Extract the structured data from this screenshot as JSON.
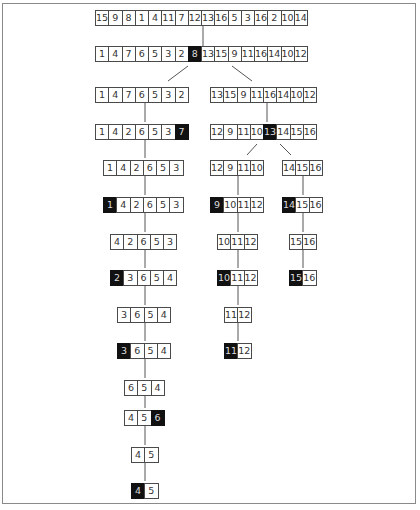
{
  "diagram": {
    "type": "quicksort-recursion-tree",
    "colors": {
      "pivot_bg": "#111111",
      "cell_border": "#4a4a4a",
      "text": "#333333"
    },
    "rows": [
      {
        "id": "r0",
        "x": 95,
        "y": 10,
        "values": [
          "15",
          "9",
          "8",
          "1",
          "4",
          "11",
          "7",
          "12",
          "13",
          "16",
          "5",
          "3",
          "16",
          "2",
          "10",
          "14"
        ],
        "pivot": -1
      },
      {
        "id": "r1",
        "x": 95,
        "y": 46,
        "values": [
          "1",
          "4",
          "7",
          "6",
          "5",
          "3",
          "2",
          "8",
          "13",
          "15",
          "9",
          "11",
          "16",
          "14",
          "10",
          "12"
        ],
        "pivot": 7
      },
      {
        "id": "r2a",
        "x": 95,
        "y": 87,
        "values": [
          "1",
          "4",
          "7",
          "6",
          "5",
          "3",
          "2"
        ],
        "pivot": -1
      },
      {
        "id": "r2b",
        "x": 210,
        "y": 87,
        "values": [
          "13",
          "15",
          "9",
          "11",
          "16",
          "14",
          "10",
          "12"
        ],
        "pivot": -1
      },
      {
        "id": "r3a",
        "x": 95,
        "y": 124,
        "values": [
          "1",
          "4",
          "2",
          "6",
          "5",
          "3",
          "7"
        ],
        "pivot": 6
      },
      {
        "id": "r3b",
        "x": 210,
        "y": 124,
        "values": [
          "12",
          "9",
          "11",
          "10",
          "13",
          "14",
          "15",
          "16"
        ],
        "pivot": 4
      },
      {
        "id": "r4a",
        "x": 103,
        "y": 160,
        "values": [
          "1",
          "4",
          "2",
          "6",
          "5",
          "3"
        ],
        "pivot": -1
      },
      {
        "id": "r4b",
        "x": 210,
        "y": 160,
        "values": [
          "12",
          "9",
          "11",
          "10"
        ],
        "pivot": -1
      },
      {
        "id": "r4c",
        "x": 282,
        "y": 160,
        "values": [
          "14",
          "15",
          "16"
        ],
        "pivot": -1
      },
      {
        "id": "r5a",
        "x": 103,
        "y": 197,
        "values": [
          "1",
          "4",
          "2",
          "6",
          "5",
          "3"
        ],
        "pivot": 0
      },
      {
        "id": "r5b",
        "x": 210,
        "y": 197,
        "values": [
          "9",
          "10",
          "11",
          "12"
        ],
        "pivot": 0
      },
      {
        "id": "r5c",
        "x": 282,
        "y": 197,
        "values": [
          "14",
          "15",
          "16"
        ],
        "pivot": 0
      },
      {
        "id": "r6a",
        "x": 110,
        "y": 234,
        "values": [
          "4",
          "2",
          "6",
          "5",
          "3"
        ],
        "pivot": -1
      },
      {
        "id": "r6b",
        "x": 217,
        "y": 234,
        "values": [
          "10",
          "11",
          "12"
        ],
        "pivot": -1
      },
      {
        "id": "r6c",
        "x": 289,
        "y": 234,
        "values": [
          "15",
          "16"
        ],
        "pivot": -1
      },
      {
        "id": "r7a",
        "x": 110,
        "y": 270,
        "values": [
          "2",
          "3",
          "6",
          "5",
          "4"
        ],
        "pivot": 0
      },
      {
        "id": "r7b",
        "x": 217,
        "y": 270,
        "values": [
          "10",
          "11",
          "12"
        ],
        "pivot": 0
      },
      {
        "id": "r7c",
        "x": 289,
        "y": 270,
        "values": [
          "15",
          "16"
        ],
        "pivot": 0
      },
      {
        "id": "r8a",
        "x": 117,
        "y": 307,
        "values": [
          "3",
          "6",
          "5",
          "4"
        ],
        "pivot": -1
      },
      {
        "id": "r8b",
        "x": 224,
        "y": 307,
        "values": [
          "11",
          "12"
        ],
        "pivot": -1
      },
      {
        "id": "r9a",
        "x": 117,
        "y": 343,
        "values": [
          "3",
          "6",
          "5",
          "4"
        ],
        "pivot": 0
      },
      {
        "id": "r9b",
        "x": 224,
        "y": 343,
        "values": [
          "11",
          "12"
        ],
        "pivot": 0
      },
      {
        "id": "r10a",
        "x": 124,
        "y": 380,
        "values": [
          "6",
          "5",
          "4"
        ],
        "pivot": -1
      },
      {
        "id": "r11a",
        "x": 124,
        "y": 410,
        "values": [
          "4",
          "5",
          "6"
        ],
        "pivot": 2
      },
      {
        "id": "r12a",
        "x": 131,
        "y": 447,
        "values": [
          "4",
          "5"
        ],
        "pivot": -1
      },
      {
        "id": "r13a",
        "x": 131,
        "y": 483,
        "values": [
          "4",
          "5"
        ],
        "pivot": 0
      }
    ],
    "connectors": [
      {
        "x1": 203,
        "y1": 26,
        "x2": 203,
        "y2": 46
      },
      {
        "x1": 188,
        "y1": 66,
        "x2": 168,
        "y2": 81
      },
      {
        "x1": 232,
        "y1": 66,
        "x2": 252,
        "y2": 81
      },
      {
        "x1": 145,
        "y1": 103,
        "x2": 145,
        "y2": 122
      },
      {
        "x1": 267,
        "y1": 103,
        "x2": 267,
        "y2": 122
      },
      {
        "x1": 145,
        "y1": 140,
        "x2": 145,
        "y2": 158
      },
      {
        "x1": 257,
        "y1": 144,
        "x2": 247,
        "y2": 155
      },
      {
        "x1": 280,
        "y1": 144,
        "x2": 291,
        "y2": 155
      },
      {
        "x1": 145,
        "y1": 176,
        "x2": 145,
        "y2": 195
      },
      {
        "x1": 238,
        "y1": 176,
        "x2": 238,
        "y2": 195
      },
      {
        "x1": 303,
        "y1": 176,
        "x2": 303,
        "y2": 195
      },
      {
        "x1": 145,
        "y1": 213,
        "x2": 145,
        "y2": 232
      },
      {
        "x1": 238,
        "y1": 213,
        "x2": 238,
        "y2": 232
      },
      {
        "x1": 303,
        "y1": 213,
        "x2": 303,
        "y2": 232
      },
      {
        "x1": 145,
        "y1": 250,
        "x2": 145,
        "y2": 268
      },
      {
        "x1": 238,
        "y1": 250,
        "x2": 238,
        "y2": 268
      },
      {
        "x1": 303,
        "y1": 250,
        "x2": 303,
        "y2": 268
      },
      {
        "x1": 145,
        "y1": 286,
        "x2": 145,
        "y2": 305
      },
      {
        "x1": 238,
        "y1": 286,
        "x2": 238,
        "y2": 305
      },
      {
        "x1": 145,
        "y1": 323,
        "x2": 145,
        "y2": 341
      },
      {
        "x1": 238,
        "y1": 323,
        "x2": 238,
        "y2": 341
      },
      {
        "x1": 145,
        "y1": 359,
        "x2": 145,
        "y2": 378
      },
      {
        "x1": 145,
        "y1": 396,
        "x2": 145,
        "y2": 408
      },
      {
        "x1": 145,
        "y1": 426,
        "x2": 145,
        "y2": 445
      },
      {
        "x1": 145,
        "y1": 463,
        "x2": 145,
        "y2": 481
      }
    ]
  }
}
